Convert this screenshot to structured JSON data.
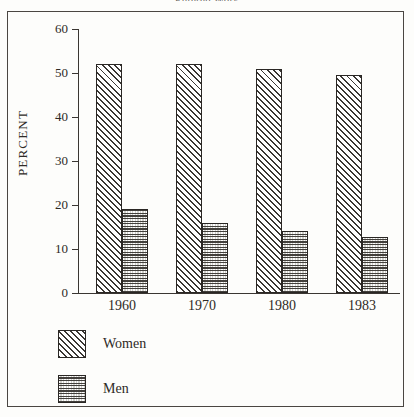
{
  "figure": {
    "title": "Entered Work",
    "background_color": "#fdfdfb",
    "frame_color": "#4a4642",
    "ink_color": "#2e2a26"
  },
  "chart_data": {
    "type": "bar",
    "title": "Entered Work",
    "xlabel": "",
    "ylabel": "PERCENT",
    "categories": [
      "1960",
      "1970",
      "1980",
      "1983"
    ],
    "series": [
      {
        "name": "Women",
        "values": [
          52,
          52,
          51,
          49.5
        ],
        "pattern": "diagonal-hatch"
      },
      {
        "name": "Men",
        "values": [
          19,
          16,
          14,
          12.8
        ],
        "pattern": "dotted-stipple"
      }
    ],
    "ylim": [
      0,
      60
    ],
    "yticks": [
      0,
      10,
      20,
      30,
      40,
      50,
      60
    ],
    "ytick_labels": [
      "0",
      "10",
      "20",
      "30",
      "40",
      "50",
      "60"
    ],
    "grid": false,
    "legend_position": "bottom-left"
  },
  "legend": {
    "items": [
      {
        "label": "Women",
        "swatch": "diagonal-hatch-swatch"
      },
      {
        "label": "Men",
        "swatch": "dotted-stipple-swatch"
      }
    ]
  }
}
